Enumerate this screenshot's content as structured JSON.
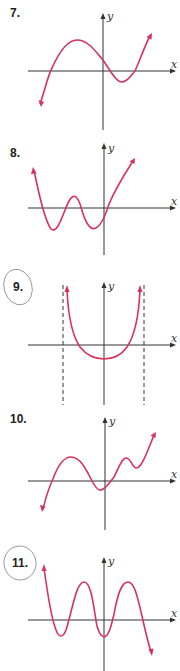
{
  "colors": {
    "curve": "#d6335c",
    "axis": "#333333",
    "circle": "#888888"
  },
  "axis_labels": {
    "x": "x",
    "y": "y"
  },
  "problems": [
    {
      "number": "7.",
      "circled": false,
      "description": "cubic-like curve, falls left, local max left of y-axis, local min right of y-axis, rises right"
    },
    {
      "number": "8.",
      "circled": false,
      "description": "quartic-like W shape, rises at both ends, two local minima and one local max"
    },
    {
      "number": "9.",
      "circled": true,
      "description": "U-shaped curve between two vertical dashed asymptotes"
    },
    {
      "number": "10.",
      "circled": false,
      "description": "polynomial with max, min, small max, small min, rising right and falling left"
    },
    {
      "number": "11.",
      "circled": true,
      "description": "oscillating polynomial, rising left end, falling right end, two maxima, two minima"
    }
  ]
}
